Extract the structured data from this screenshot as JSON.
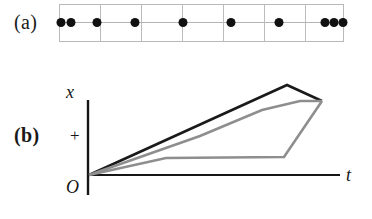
{
  "figure": {
    "panels": [
      {
        "key": "a",
        "label": "(a)"
      },
      {
        "key": "b",
        "label": "(b)"
      }
    ]
  },
  "panel_a": {
    "label": "(a)",
    "description": "dot-plot-strip",
    "cells": 7,
    "box": {
      "left": 59,
      "top": 4,
      "width": 285,
      "height": 38
    },
    "dividers_px": [
      41,
      82,
      123,
      164,
      205,
      246
    ],
    "baseline_y_px": 18,
    "dot_color": "#111111",
    "grid_color": "#bcbcbc",
    "dots_px": [
      2,
      12,
      38,
      76,
      124,
      172,
      220,
      266,
      275,
      284
    ]
  },
  "panel_b": {
    "label": "(b)",
    "axis_x_label": "t",
    "axis_y_label": "x",
    "origin_label": "O",
    "plus_label": "+"
  },
  "chart_data": {
    "type": "line",
    "title": "",
    "xlabel": "t",
    "ylabel": "x",
    "origin_label": "O",
    "grid": false,
    "legend": "none",
    "xlim": [
      0,
      10
    ],
    "ylim": [
      0,
      10
    ],
    "axes": {
      "x_axis_pixels": {
        "x0": 88,
        "x1": 340,
        "y": 115
      },
      "y_axis_pixels": {
        "y0": 40,
        "y1": 135,
        "x": 88
      }
    },
    "series": [
      {
        "name": "upper-trajectory",
        "color": "#1a1a1a",
        "width": 2.6,
        "points_px": [
          [
            89,
            115
          ],
          [
            287,
            25
          ],
          [
            322,
            41
          ]
        ]
      },
      {
        "name": "middle-trajectory",
        "color": "#8e8e8e",
        "width": 2.6,
        "points_px": [
          [
            89,
            115
          ],
          [
            200,
            76
          ],
          [
            262,
            50
          ],
          [
            300,
            41
          ],
          [
            322,
            41
          ]
        ]
      },
      {
        "name": "lower-trajectory",
        "color": "#8e8e8e",
        "width": 2.6,
        "points_px": [
          [
            89,
            115
          ],
          [
            166,
            98
          ],
          [
            284,
            97
          ],
          [
            322,
            41
          ]
        ]
      }
    ]
  }
}
